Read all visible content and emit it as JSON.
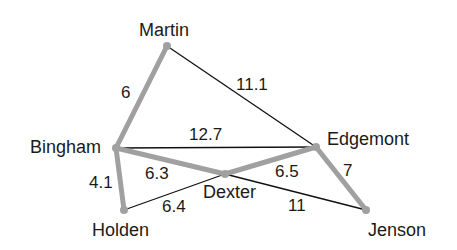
{
  "graph": {
    "highlight_color": "#a0a0a0",
    "edge_color": "#111111",
    "nodes": {
      "martin": {
        "label": "Martin",
        "x": 167,
        "y": 46,
        "lx": 139,
        "ly": 36
      },
      "bingham": {
        "label": "Bingham",
        "x": 116,
        "y": 148,
        "lx": 30,
        "ly": 153
      },
      "edgemont": {
        "label": "Edgemont",
        "x": 316,
        "y": 147,
        "lx": 327,
        "ly": 145
      },
      "dexter": {
        "label": "Dexter",
        "x": 225,
        "y": 174,
        "lx": 203,
        "ly": 198
      },
      "holden": {
        "label": "Holden",
        "x": 124,
        "y": 210,
        "lx": 92,
        "ly": 236
      },
      "jenson": {
        "label": "Jenson",
        "x": 366,
        "y": 210,
        "lx": 368,
        "ly": 236
      }
    },
    "edges": [
      {
        "from": "martin",
        "to": "bingham",
        "weight": "6",
        "highlighted": true,
        "lx": 121,
        "ly": 98
      },
      {
        "from": "martin",
        "to": "edgemont",
        "weight": "11.1",
        "highlighted": false,
        "lx": 236,
        "ly": 90
      },
      {
        "from": "bingham",
        "to": "edgemont",
        "weight": "12.7",
        "highlighted": false,
        "lx": 189,
        "ly": 140
      },
      {
        "from": "bingham",
        "to": "dexter",
        "weight": "6.3",
        "highlighted": true,
        "lx": 145,
        "ly": 179
      },
      {
        "from": "bingham",
        "to": "holden",
        "weight": "4.1",
        "highlighted": true,
        "lx": 89,
        "ly": 188
      },
      {
        "from": "holden",
        "to": "dexter",
        "weight": "6.4",
        "highlighted": false,
        "lx": 162,
        "ly": 212
      },
      {
        "from": "dexter",
        "to": "edgemont",
        "weight": "6.5",
        "highlighted": true,
        "lx": 275,
        "ly": 177
      },
      {
        "from": "dexter",
        "to": "jenson",
        "weight": "11",
        "highlighted": false,
        "lx": 288,
        "ly": 211
      },
      {
        "from": "edgemont",
        "to": "jenson",
        "weight": "7",
        "highlighted": true,
        "lx": 343,
        "ly": 176
      }
    ]
  }
}
